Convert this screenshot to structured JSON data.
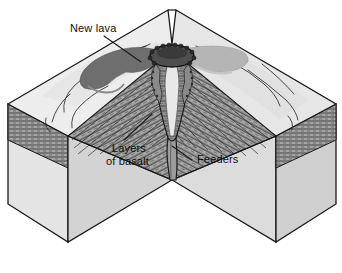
{
  "figure": {
    "type": "geological-block-diagram",
    "background_color": "#ffffff"
  },
  "labels": [
    {
      "id": "new-lava",
      "text": "New lava",
      "lines": [
        "New lava"
      ],
      "x": 70,
      "y": 32,
      "leader": "from label down-right to dark lava flow on upper surface"
    },
    {
      "id": "layers-of-basalt",
      "text": "Layers of basalt",
      "lines": [
        "Layers",
        "of basalt"
      ],
      "x": 110,
      "y": 152,
      "leader": "from label up-right into the striped layered slope"
    },
    {
      "id": "feeders",
      "text": "Feeders",
      "lines": [
        "Feeders"
      ],
      "x": 197,
      "y": 162,
      "leader": "from label up-left to the narrow vertical conduit"
    }
  ],
  "colors": {
    "outline": "#1a1a1a",
    "block_face_left": "#e3e3e3",
    "block_face_front_left": "#d2d2d2",
    "block_face_front_right": "#dcdcdc",
    "block_face_right": "#cfcfcf",
    "top_surface": "#ececec",
    "top_surface_shaded": "#e0e0e0",
    "lava_dark": "#6e6e6e",
    "lava_light": "#b8b8b8",
    "basalt_band": "#9a9a9a",
    "basalt_stripe": "#3a3a3a",
    "crater_dark": "#4a4a4a",
    "vent_fill": "#8d8d8d",
    "feeder_fill": "#9c9c9c",
    "label_text": "#111111",
    "leader_line": "#1a1a1a"
  },
  "features": {
    "crater": {
      "name": "summit crater with scalloped rim",
      "cx": 172,
      "cy": 56
    },
    "vent": {
      "name": "central volcanic vent / conduit stack"
    },
    "feeder": {
      "name": "feeder dike descending from vent"
    },
    "notch": {
      "name": "v-shaped cutaway notch",
      "apex_x": 172,
      "apex_y": 180
    },
    "lava_flows": [
      {
        "side": "left",
        "tone": "dark"
      },
      {
        "side": "right",
        "tone": "light"
      }
    ],
    "basalt_layer_count": 9
  }
}
